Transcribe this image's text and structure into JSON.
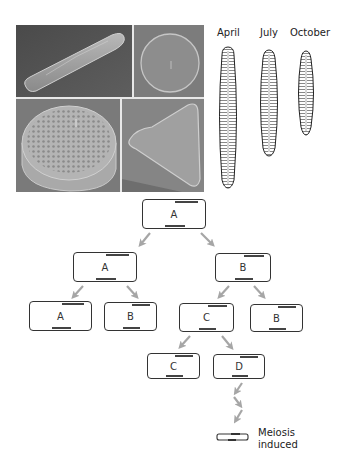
{
  "figure": {
    "photos": {
      "panels": [
        {
          "id": "elongated-pennate",
          "description": "SEM elongated spindle-shaped diatom"
        },
        {
          "id": "round-centric-valve",
          "description": "SEM circular centric diatom valve"
        },
        {
          "id": "cylindrical-centric",
          "description": "SEM cylindrical centric diatom with areolae"
        },
        {
          "id": "triangular-diatom",
          "description": "SEM triangular diatom"
        }
      ]
    },
    "seasonal_drawings": {
      "labels": [
        "April",
        "July",
        "October"
      ]
    },
    "lineage_tree": {
      "cells": [
        {
          "id": "root",
          "label": "A"
        },
        {
          "id": "l1-left",
          "label": "A"
        },
        {
          "id": "l1-right",
          "label": "B"
        },
        {
          "id": "l2-a",
          "label": "A"
        },
        {
          "id": "l2-b",
          "label": "B"
        },
        {
          "id": "l2-c",
          "label": "C"
        },
        {
          "id": "l2-b2",
          "label": "B"
        },
        {
          "id": "l3-c",
          "label": "C"
        },
        {
          "id": "l3-d",
          "label": "D"
        }
      ],
      "meiosis_label_line1": "Meiosis",
      "meiosis_label_line2": "induced",
      "colors": {
        "arrow": "#a6a6a6",
        "cell_border": "#333333",
        "band": "#444444"
      }
    }
  }
}
